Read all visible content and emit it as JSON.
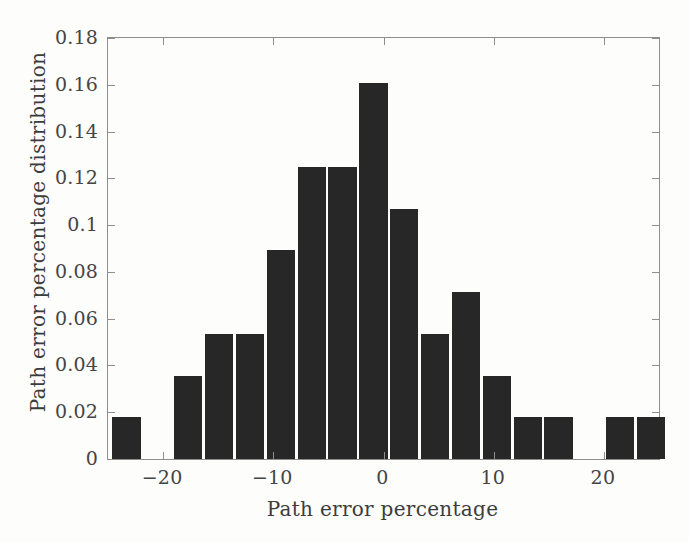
{
  "chart_data": {
    "type": "bar",
    "title": "",
    "xlabel": "Path error percentage",
    "ylabel": "Path error percentage distribution",
    "xlim": [
      -25.0,
      25.0
    ],
    "ylim": [
      0,
      0.18
    ],
    "grid": false,
    "legend": null,
    "bar_color": "#272727",
    "bin_width": 2.8,
    "x_ticks": [
      -20,
      -10,
      0,
      10,
      20
    ],
    "x_tick_labels": [
      "−20",
      "−10",
      "0",
      "10",
      "20"
    ],
    "y_ticks": [
      0,
      0.02,
      0.04,
      0.06,
      0.08,
      0.1,
      0.12,
      0.14,
      0.16,
      0.18
    ],
    "y_tick_labels": [
      "0",
      "0.02",
      "0.04",
      "0.06",
      "0.08",
      "0.1",
      "0.12",
      "0.14",
      "0.16",
      "0.18"
    ],
    "bins": [
      {
        "center": -23.2,
        "left": -24.6,
        "right": -21.8,
        "value": 0.0179
      },
      {
        "center": -20.4,
        "left": -21.8,
        "right": -19.0,
        "value": 0.0
      },
      {
        "center": -17.6,
        "left": -19.0,
        "right": -16.2,
        "value": 0.0357
      },
      {
        "center": -14.8,
        "left": -16.2,
        "right": -13.4,
        "value": 0.0536
      },
      {
        "center": -12.0,
        "left": -13.4,
        "right": -10.6,
        "value": 0.0536
      },
      {
        "center": -9.2,
        "left": -10.6,
        "right": -7.8,
        "value": 0.0893
      },
      {
        "center": -6.4,
        "left": -7.8,
        "right": -5.0,
        "value": 0.125
      },
      {
        "center": -3.6,
        "left": -5.0,
        "right": -2.2,
        "value": 0.125
      },
      {
        "center": -0.8,
        "left": -2.2,
        "right": 0.6,
        "value": 0.1607
      },
      {
        "center": 2.0,
        "left": 0.6,
        "right": 3.4,
        "value": 0.1071
      },
      {
        "center": 4.8,
        "left": 3.4,
        "right": 6.2,
        "value": 0.0536
      },
      {
        "center": 7.6,
        "left": 6.2,
        "right": 9.0,
        "value": 0.0714
      },
      {
        "center": 10.4,
        "left": 9.0,
        "right": 11.8,
        "value": 0.0357
      },
      {
        "center": 13.2,
        "left": 11.8,
        "right": 14.6,
        "value": 0.0179
      },
      {
        "center": 16.0,
        "left": 14.6,
        "right": 17.4,
        "value": 0.0179
      },
      {
        "center": 18.8,
        "left": 17.4,
        "right": 20.2,
        "value": 0.0
      },
      {
        "center": 21.6,
        "left": 20.2,
        "right": 23.0,
        "value": 0.0179
      },
      {
        "center": 24.4,
        "left": 23.0,
        "right": 25.8,
        "value": 0.0179
      }
    ],
    "categories": [
      "-23.2",
      "-20.4",
      "-17.6",
      "-14.8",
      "-12.0",
      "-9.2",
      "-6.4",
      "-3.6",
      "-0.8",
      "2.0",
      "4.8",
      "7.6",
      "10.4",
      "13.2",
      "16.0",
      "18.8",
      "21.6",
      "24.4"
    ],
    "values": [
      0.0179,
      0.0,
      0.0357,
      0.0536,
      0.0536,
      0.0893,
      0.125,
      0.125,
      0.1607,
      0.1071,
      0.0536,
      0.0714,
      0.0357,
      0.0179,
      0.0179,
      0.0,
      0.0179,
      0.0179
    ]
  }
}
